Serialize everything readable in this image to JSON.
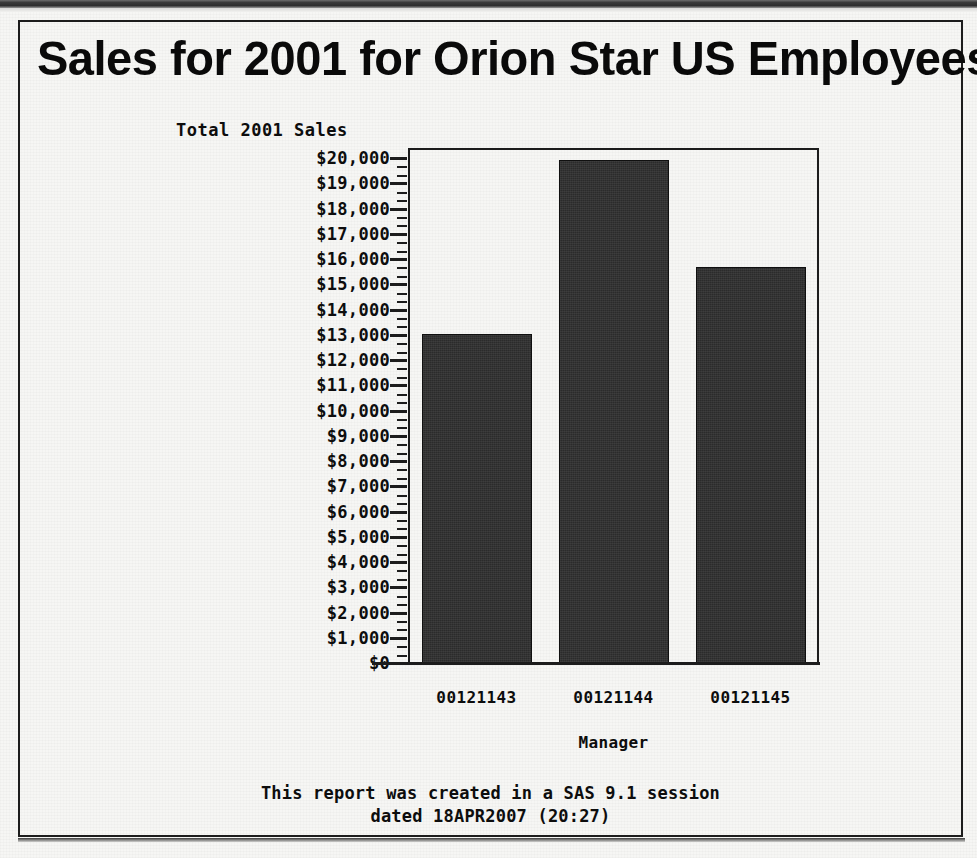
{
  "document": {
    "title": "Sales for 2001 for Orion Star US Employees",
    "footnote_line1": "This report was created in a SAS 9.1 session",
    "footnote_line2": "dated 18APR2007 (20:27)"
  },
  "chart_data": {
    "type": "bar",
    "title": "Sales for 2001 for Orion Star US Employees",
    "xlabel": "Manager",
    "ylabel": "Total 2001 Sales",
    "categories": [
      "00121143",
      "00121144",
      "00121145"
    ],
    "values": [
      13100,
      20000,
      15760
    ],
    "ylim": [
      0,
      20000
    ],
    "ytick_step": 1000,
    "ytick_labels": [
      "$20,000",
      "$19,000",
      "$18,000",
      "$17,000",
      "$16,000",
      "$15,000",
      "$14,000",
      "$13,000",
      "$12,000",
      "$11,000",
      "$10,000",
      "$9,000",
      "$8,000",
      "$7,000",
      "$6,000",
      "$5,000",
      "$4,000",
      "$3,000",
      "$2,000",
      "$1,000",
      "$0"
    ],
    "ytick_values": [
      20000,
      19000,
      18000,
      17000,
      16000,
      15000,
      14000,
      13000,
      12000,
      11000,
      10000,
      9000,
      8000,
      7000,
      6000,
      5000,
      4000,
      3000,
      2000,
      1000,
      0
    ],
    "minor_ticks_per_interval": 2,
    "grid": false,
    "legend": null,
    "bar_color": "#2b2b2b",
    "axis_color": "#1c1c1c",
    "background_color": "#f6f6f4"
  }
}
